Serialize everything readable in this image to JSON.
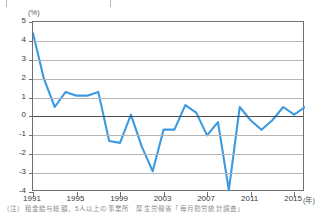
{
  "page": {
    "top_strip_ghost_text": "",
    "footnote": "（注）租金給与総額、5人以上の事業所　厚生労働省「毎月勤労統計調査」"
  },
  "chart_data": {
    "type": "line",
    "title": "",
    "subtitle": "",
    "xlabel": "(年)",
    "ylabel": "(%)",
    "ylim": [
      -4,
      5
    ],
    "ytick_step": 1,
    "ytick_labels": [
      "5",
      "4",
      "3",
      "2",
      "1",
      "0",
      "-1",
      "-2",
      "-3",
      "-4"
    ],
    "xlim": [
      1991,
      2016
    ],
    "xtick_labels": [
      "1991",
      "1995",
      "1999",
      "2003",
      "2007",
      "2011",
      "2015"
    ],
    "xticks": [
      1991,
      1995,
      1999,
      2003,
      2007,
      2011,
      2015
    ],
    "grid": true,
    "legend": "none",
    "series": [
      {
        "name": "現金給与総額前年比",
        "color": "#3b9ae1",
        "x": [
          1991,
          1992,
          1993,
          1994,
          1995,
          1996,
          1997,
          1998,
          1999,
          2000,
          2001,
          2002,
          2003,
          2004,
          2005,
          2006,
          2007,
          2008,
          2009,
          2010,
          2011,
          2012,
          2013,
          2014,
          2015,
          2016
        ],
        "values": [
          4.4,
          2.0,
          0.5,
          1.3,
          1.1,
          1.1,
          1.3,
          -1.3,
          -1.4,
          0.1,
          -1.6,
          -2.9,
          -0.7,
          -0.7,
          0.6,
          0.2,
          -1.0,
          -0.3,
          -3.9,
          0.5,
          -0.2,
          -0.7,
          -0.2,
          0.5,
          0.1,
          0.5
        ]
      }
    ]
  }
}
